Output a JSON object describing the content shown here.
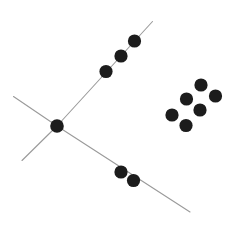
{
  "figure": {
    "width": 240,
    "height": 235,
    "background_color": "#ffffff",
    "dot_color": "#1c1c1c",
    "line_color": "#9a9a9a",
    "line_width": 1.1,
    "dot_radius": 6.6,
    "center_dot_radius": 6.8
  },
  "lines": [
    {
      "name": "upper-right-diagonal-line",
      "x1": 57,
      "y1": 126,
      "x2": 152.5,
      "y2": 21.5
    },
    {
      "name": "lower-right-diagonal-line",
      "x1": 57,
      "y1": 126,
      "x2": 190,
      "y2": 212
    },
    {
      "name": "upper-left-diagonal-line",
      "x1": 57,
      "y1": 126,
      "x2": 13.5,
      "y2": 96.5
    },
    {
      "name": "lower-left-diagonal-line",
      "x1": 57,
      "y1": 126,
      "x2": 22,
      "y2": 160.5
    }
  ],
  "dots": [
    {
      "name": "center-junction-dot",
      "group": "center",
      "cx": 57,
      "cy": 126,
      "r": 6.8
    },
    {
      "name": "upper-line-dot-1",
      "group": "upper-branch",
      "cx": 106,
      "cy": 71.5,
      "r": 6.6
    },
    {
      "name": "upper-line-dot-2",
      "group": "upper-branch",
      "cx": 121,
      "cy": 56,
      "r": 6.6
    },
    {
      "name": "upper-line-dot-3",
      "group": "upper-branch",
      "cx": 134.5,
      "cy": 41,
      "r": 6.6
    },
    {
      "name": "lower-line-dot-1",
      "group": "lower-branch",
      "cx": 121,
      "cy": 172,
      "r": 6.6
    },
    {
      "name": "lower-line-dot-2",
      "group": "lower-branch",
      "cx": 133.5,
      "cy": 180.5,
      "r": 6.6
    },
    {
      "name": "cluster-dot-1",
      "group": "cluster",
      "cx": 201,
      "cy": 85,
      "r": 6.6
    },
    {
      "name": "cluster-dot-2",
      "group": "cluster",
      "cx": 215.5,
      "cy": 96,
      "r": 6.6
    },
    {
      "name": "cluster-dot-3",
      "group": "cluster",
      "cx": 186.5,
      "cy": 99,
      "r": 6.6
    },
    {
      "name": "cluster-dot-4",
      "group": "cluster",
      "cx": 200,
      "cy": 110,
      "r": 6.6
    },
    {
      "name": "cluster-dot-5",
      "group": "cluster",
      "cx": 172,
      "cy": 115,
      "r": 6.6
    },
    {
      "name": "cluster-dot-6",
      "group": "cluster",
      "cx": 186,
      "cy": 125.5,
      "r": 6.6
    }
  ]
}
